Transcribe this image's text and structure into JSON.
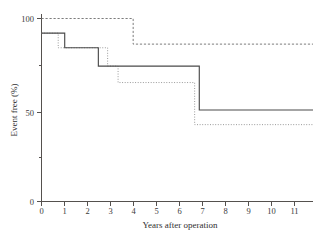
{
  "chart_data": {
    "type": "line",
    "title": "",
    "xlabel": "Years after operation",
    "ylabel": "Event free (%)",
    "xlim": [
      0,
      11.7
    ],
    "ylim": [
      0,
      105
    ],
    "xticks": [
      0,
      1,
      2,
      3,
      4,
      5,
      6,
      7,
      8,
      9,
      10,
      11
    ],
    "xtick_labels": [
      "0",
      "1",
      "2",
      "3",
      "4",
      "5",
      "6",
      "7",
      "8",
      "9",
      "10",
      "11"
    ],
    "yticks": [
      0,
      50,
      100
    ],
    "ytick_labels": [
      "0",
      "50",
      "100"
    ],
    "grid": false,
    "legend": "none",
    "series": [
      {
        "name": "dashed-curve",
        "style": "dashed",
        "color": "#7d7d7d",
        "step": "post",
        "points": [
          {
            "x": 0,
            "y": 100
          },
          {
            "x": 3.95,
            "y": 100
          },
          {
            "x": 3.95,
            "y": 86
          },
          {
            "x": 11.7,
            "y": 86
          }
        ]
      },
      {
        "name": "solid-curve",
        "style": "solid",
        "color": "#4a4a4a",
        "step": "post",
        "points": [
          {
            "x": 0,
            "y": 92
          },
          {
            "x": 0.75,
            "y": 92
          },
          {
            "x": 0.75,
            "y": 92
          },
          {
            "x": 1.0,
            "y": 92
          },
          {
            "x": 1.0,
            "y": 84
          },
          {
            "x": 2.45,
            "y": 84
          },
          {
            "x": 2.45,
            "y": 74
          },
          {
            "x": 2.9,
            "y": 74
          },
          {
            "x": 2.9,
            "y": 74
          },
          {
            "x": 6.8,
            "y": 74
          },
          {
            "x": 6.8,
            "y": 50
          },
          {
            "x": 11.7,
            "y": 50
          }
        ]
      },
      {
        "name": "dotted-curve",
        "style": "dotted",
        "color": "#9a9a9a",
        "step": "post",
        "points": [
          {
            "x": 0,
            "y": 92
          },
          {
            "x": 0.72,
            "y": 92
          },
          {
            "x": 0.72,
            "y": 84
          },
          {
            "x": 2.45,
            "y": 84
          },
          {
            "x": 2.45,
            "y": 84
          },
          {
            "x": 2.85,
            "y": 84
          },
          {
            "x": 2.85,
            "y": 74
          },
          {
            "x": 3.3,
            "y": 74
          },
          {
            "x": 3.3,
            "y": 65
          },
          {
            "x": 6.6,
            "y": 65
          },
          {
            "x": 6.6,
            "y": 42
          },
          {
            "x": 11.7,
            "y": 42
          }
        ]
      }
    ]
  }
}
